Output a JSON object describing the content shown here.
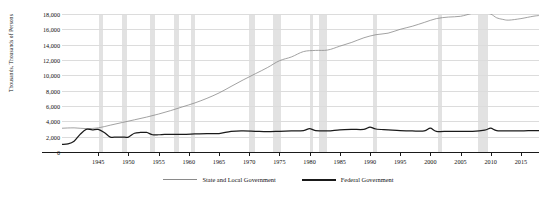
{
  "title_fragment": "··",
  "legend": {
    "position": "bottom-center",
    "items": [
      {
        "label": "State and Local Government",
        "color": "#8a8a8a",
        "key": "state_local"
      },
      {
        "label": "Federal Government",
        "color": "#1a1a1a",
        "key": "federal"
      }
    ]
  },
  "chart_data": {
    "type": "line",
    "title": "",
    "xlabel": "",
    "ylabel": "Thousands, Thousands of Persons",
    "xlim": [
      1939,
      2018
    ],
    "ylim": [
      0,
      18000
    ],
    "ytick_values": [
      0,
      2000,
      4000,
      6000,
      8000,
      10000,
      12000,
      14000,
      16000,
      18000
    ],
    "ytick_labels": [
      "0",
      "2,000",
      "4,000",
      "6,000",
      "8,000",
      "10,000",
      "12,000",
      "14,000",
      "16,000",
      "18,000"
    ],
    "xtick_values": [
      1945,
      1950,
      1955,
      1960,
      1965,
      1970,
      1975,
      1980,
      1985,
      1990,
      1995,
      2000,
      2005,
      2010,
      2015
    ],
    "xtick_labels": [
      "1945",
      "1950",
      "1955",
      "1960",
      "1965",
      "1970",
      "1975",
      "1980",
      "1985",
      "1990",
      "1995",
      "2000",
      "2005",
      "2010",
      "2015"
    ],
    "grid": "horizontal",
    "legend_position": "bottom-center",
    "recession_bands": [
      [
        1945.1,
        1945.8
      ],
      [
        1948.9,
        1949.8
      ],
      [
        1953.5,
        1954.4
      ],
      [
        1957.6,
        1958.4
      ],
      [
        1960.3,
        1961.1
      ],
      [
        1969.9,
        1970.9
      ],
      [
        1973.9,
        1975.2
      ],
      [
        1980.1,
        1980.5
      ],
      [
        1981.6,
        1982.9
      ],
      [
        1990.5,
        1991.2
      ],
      [
        2001.2,
        2001.9
      ],
      [
        2007.9,
        2009.5
      ]
    ],
    "series": [
      {
        "name": "State and Local Government",
        "color": "#8a8a8a",
        "x": [
          1939,
          1941,
          1943,
          1945,
          1947,
          1949,
          1951,
          1953,
          1955,
          1957,
          1959,
          1961,
          1963,
          1965,
          1967,
          1969,
          1971,
          1973,
          1975,
          1977,
          1979,
          1981,
          1983,
          1985,
          1987,
          1989,
          1991,
          1993,
          1995,
          1997,
          1999,
          2001,
          2003,
          2005,
          2007,
          2008,
          2009,
          2010,
          2011,
          2012,
          2013,
          2015,
          2017,
          2018
        ],
        "values": [
          3100,
          3150,
          3050,
          3150,
          3500,
          3850,
          4200,
          4550,
          4950,
          5400,
          5900,
          6400,
          7000,
          7700,
          8550,
          9400,
          10200,
          11000,
          11900,
          12400,
          13100,
          13250,
          13300,
          13800,
          14300,
          14900,
          15300,
          15500,
          16000,
          16400,
          16900,
          17400,
          17600,
          17700,
          18100,
          18200,
          18100,
          18000,
          17500,
          17300,
          17200,
          17400,
          17700,
          17800
        ]
      },
      {
        "name": "Federal Government",
        "color": "#1a1a1a",
        "x": [
          1939,
          1940,
          1941,
          1942,
          1943,
          1944,
          1945,
          1946,
          1947,
          1948,
          1949,
          1950,
          1951,
          1952,
          1953,
          1954,
          1955,
          1956,
          1957,
          1959,
          1961,
          1963,
          1965,
          1967,
          1969,
          1971,
          1973,
          1975,
          1977,
          1979,
          1980,
          1981,
          1983,
          1985,
          1987,
          1989,
          1990,
          1991,
          1993,
          1995,
          1997,
          1999,
          2000,
          2001,
          2003,
          2005,
          2007,
          2009,
          2010,
          2011,
          2013,
          2015,
          2017,
          2018
        ],
        "values": [
          1000,
          1050,
          1400,
          2300,
          2950,
          2900,
          2950,
          2550,
          1950,
          1950,
          1950,
          1950,
          2450,
          2550,
          2550,
          2250,
          2250,
          2300,
          2300,
          2300,
          2350,
          2400,
          2400,
          2700,
          2750,
          2700,
          2650,
          2700,
          2750,
          2800,
          3050,
          2800,
          2750,
          2900,
          2950,
          2950,
          3250,
          3000,
          2900,
          2800,
          2750,
          2750,
          3100,
          2700,
          2700,
          2700,
          2700,
          2850,
          3100,
          2800,
          2750,
          2750,
          2800,
          2800
        ]
      }
    ]
  }
}
